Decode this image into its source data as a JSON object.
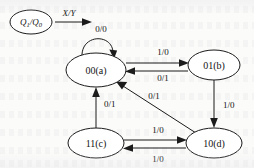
{
  "figure": {
    "kind": "state-transition-diagram",
    "legend": {
      "node_label_top": "Q",
      "node_label_sub1": "1",
      "node_label_mid": "/Q",
      "node_label_sub0": "0",
      "arrow_label": "X/Y"
    },
    "states": [
      {
        "id": "a",
        "label": "00(a)",
        "cx": 96,
        "cy": 70,
        "rx": 30,
        "ry": 17
      },
      {
        "id": "b",
        "label": "01(b)",
        "cx": 214,
        "cy": 65,
        "rx": 26,
        "ry": 15
      },
      {
        "id": "c",
        "label": "11(c)",
        "cx": 96,
        "cy": 143,
        "rx": 28,
        "ry": 15
      },
      {
        "id": "d",
        "label": "10(d)",
        "cx": 214,
        "cy": 143,
        "rx": 28,
        "ry": 15
      }
    ],
    "transitions": [
      {
        "from": "a",
        "to": "a",
        "label": "0/0",
        "label_x": 101,
        "label_y": 32,
        "shape": "self-loop-top"
      },
      {
        "from": "a",
        "to": "b",
        "label": "1/0",
        "label_x": 163,
        "label_y": 54,
        "shape": "straight-top"
      },
      {
        "from": "b",
        "to": "a",
        "label": "0/1",
        "label_x": 163,
        "label_y": 79,
        "shape": "straight-bottom"
      },
      {
        "from": "b",
        "to": "d",
        "label": "1/0",
        "label_x": 222,
        "label_y": 106,
        "shape": "vertical-right"
      },
      {
        "from": "d",
        "to": "a",
        "label": "0/1",
        "label_x": 152,
        "label_y": 99,
        "shape": "diagonal"
      },
      {
        "from": "c",
        "to": "a",
        "label": "0/1",
        "label_x": 103,
        "label_y": 105,
        "shape": "vertical-left"
      },
      {
        "from": "c",
        "to": "d",
        "label": "1/0",
        "label_x": 158,
        "label_y": 132,
        "shape": "straight-top"
      },
      {
        "from": "d",
        "to": "c",
        "label": "1/0",
        "label_x": 158,
        "label_y": 161,
        "shape": "straight-bottom"
      }
    ],
    "colors": {
      "ink": "#1b1b1b",
      "paper": "#fbfbfa",
      "node_fill": "#ffffff"
    }
  }
}
